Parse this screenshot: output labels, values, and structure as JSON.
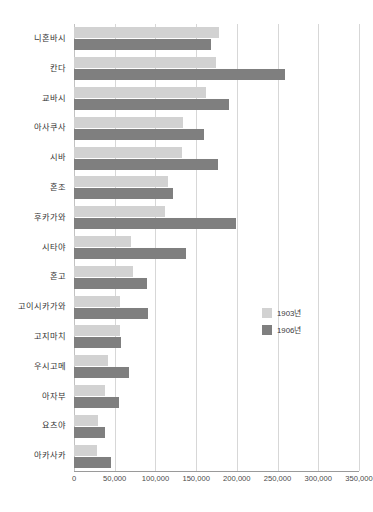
{
  "chart_data": {
    "type": "bar",
    "orientation": "horizontal",
    "title": "",
    "xlabel": "",
    "ylabel": "",
    "xlim": [
      0,
      350000
    ],
    "xticks": [
      0,
      50000,
      100000,
      150000,
      200000,
      250000,
      300000,
      350000
    ],
    "xtick_labels": [
      "0",
      "50,000",
      "100,000",
      "150,000",
      "200,000",
      "250,000",
      "300,000",
      "350,000"
    ],
    "grid": true,
    "legend_position": "center-right",
    "categories": [
      "니혼바시",
      "칸다",
      "교바시",
      "아사쿠사",
      "시바",
      "혼조",
      "후카가와",
      "시타야",
      "혼고",
      "고이시카가와",
      "고지마치",
      "우시고메",
      "아자부",
      "요츠야",
      "아카사카"
    ],
    "series": [
      {
        "name": "1903년",
        "color": "#d2d2d2",
        "values": [
          178000,
          174000,
          162000,
          134000,
          133000,
          115000,
          112000,
          70000,
          73000,
          57000,
          57000,
          42000,
          38000,
          30000,
          28000
        ]
      },
      {
        "name": "1906년",
        "color": "#7f7f7f",
        "values": [
          168000,
          259000,
          190000,
          160000,
          177000,
          122000,
          199000,
          137000,
          90000,
          91000,
          58000,
          68000,
          55000,
          38000,
          46000
        ]
      }
    ]
  },
  "legend": {
    "items": [
      {
        "label": "1903년",
        "color": "#d2d2d2"
      },
      {
        "label": "1906년",
        "color": "#7f7f7f"
      }
    ]
  },
  "colors": {
    "series_1903": "#d2d2d2",
    "series_1906": "#7f7f7f",
    "gridline": "#d7d7d7",
    "axis": "#9a9a9a",
    "background": "#ffffff",
    "text": "#3a3a3a"
  }
}
